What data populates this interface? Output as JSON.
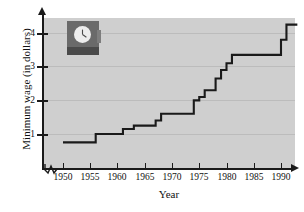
{
  "chart_data": {
    "type": "line",
    "subtype": "step",
    "title": "",
    "xlabel": "Year",
    "ylabel": "Minimum wage (in dollars)",
    "xlim": [
      1949,
      1994
    ],
    "ylim": [
      0,
      4.6
    ],
    "grid": true,
    "legend": "none",
    "x_ticks": [
      1950,
      1955,
      1960,
      1965,
      1970,
      1975,
      1980,
      1985,
      1990
    ],
    "y_ticks": [
      1,
      2,
      3,
      4
    ],
    "axis_break_x": true,
    "series": [
      {
        "name": "Federal minimum wage",
        "step": "post",
        "points": [
          {
            "year": 1950,
            "wage": 0.75
          },
          {
            "year": 1956,
            "wage": 1.0
          },
          {
            "year": 1961,
            "wage": 1.15
          },
          {
            "year": 1963,
            "wage": 1.25
          },
          {
            "year": 1967,
            "wage": 1.4
          },
          {
            "year": 1968,
            "wage": 1.6
          },
          {
            "year": 1974,
            "wage": 2.0
          },
          {
            "year": 1975,
            "wage": 2.1
          },
          {
            "year": 1976,
            "wage": 2.3
          },
          {
            "year": 1978,
            "wage": 2.65
          },
          {
            "year": 1979,
            "wage": 2.9
          },
          {
            "year": 1980,
            "wage": 3.1
          },
          {
            "year": 1981,
            "wage": 3.35
          },
          {
            "year": 1990,
            "wage": 3.8
          },
          {
            "year": 1991,
            "wage": 4.25
          },
          {
            "year": 1993,
            "wage": 4.25
          }
        ]
      }
    ]
  },
  "axes": {
    "x_title": "Year",
    "y_title": "Minimum wage (in dollars)",
    "x_tick_labels": [
      "1950",
      "1955",
      "1960",
      "1965",
      "1970",
      "1975",
      "1980",
      "1985",
      "1990"
    ],
    "y_tick_labels": [
      "1",
      "2",
      "3",
      "4"
    ]
  },
  "inset": {
    "name": "time-clock-photo",
    "description": "clock"
  },
  "colors": {
    "panel_background": "#cfcfcf",
    "gridline": "#bcbcbc",
    "axis": "#1a1a1a",
    "curve": "#1a1a1a",
    "page_background": "#ffffff"
  }
}
